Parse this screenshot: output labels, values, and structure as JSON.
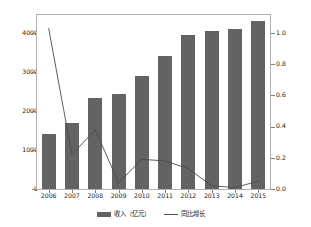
{
  "chart_data": {
    "type": "bar",
    "title": "",
    "xlabel": "",
    "ylabel": "",
    "categories": [
      "2006",
      "2007",
      "2008",
      "2009",
      "2010",
      "2011",
      "2012",
      "2013",
      "2014",
      "2015"
    ],
    "series": [
      {
        "name": "收入（亿元）",
        "type": "bar",
        "axis": "left",
        "color": "#636363",
        "values": [
          1400,
          1700,
          2340,
          2430,
          2890,
          3420,
          3950,
          4040,
          4090,
          4310
        ]
      },
      {
        "name": "同比增长",
        "type": "line",
        "axis": "right",
        "color": "#4d4d4d",
        "values": [
          1.03,
          0.22,
          0.38,
          0.04,
          0.19,
          0.18,
          0.13,
          0.02,
          0.01,
          0.05
        ]
      }
    ],
    "left_axis": {
      "ticks": [
        "0",
        "1000",
        "2000",
        "3000",
        "4000"
      ],
      "tick_values": [
        0,
        1000,
        2000,
        3000,
        4000
      ],
      "ylim": [
        0,
        4460
      ]
    },
    "right_axis": {
      "ticks": [
        "0.0",
        "0.2",
        "0.4",
        "0.6",
        "0.8",
        "1.0"
      ],
      "tick_values": [
        0.0,
        0.2,
        0.4,
        0.6,
        0.8,
        1.0
      ],
      "ylim": [
        0,
        1.115
      ]
    },
    "legend": {
      "position": "bottom",
      "entries": [
        {
          "label": "收入（亿元）",
          "marker": "bar-swatch"
        },
        {
          "label": "同比增长",
          "marker": "line-swatch"
        }
      ]
    },
    "grid": false
  }
}
